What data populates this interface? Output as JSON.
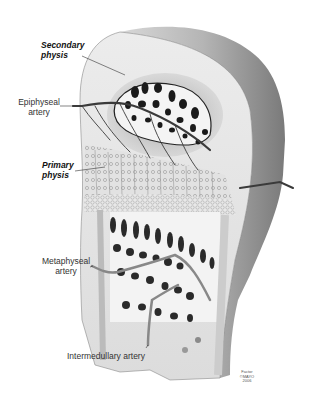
{
  "figure": {
    "labels": {
      "secondary_physis": [
        "Secondary",
        "physis"
      ],
      "epiphyseal_artery": [
        "Epiphyseal",
        "artery"
      ],
      "primary_physis": [
        "Primary",
        "physis"
      ],
      "metaphyseal_artery": [
        "Metaphyseal",
        "artery"
      ],
      "intermedullary_artery": "Intermedullary artery"
    },
    "credit": [
      "Factor",
      "©MAYO",
      "2006"
    ],
    "colors": {
      "background": "#ffffff",
      "bone_outer": "#9a9a9a",
      "cut_surface": "#e6e6e6",
      "artery": "#3a3a3a",
      "trabecula_dark": "#1a1a1a"
    }
  }
}
